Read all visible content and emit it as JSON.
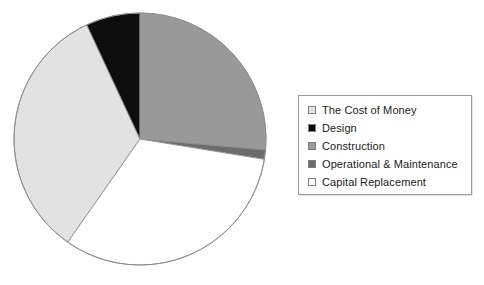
{
  "chart_data": {
    "type": "pie",
    "title": "",
    "subtitle": "",
    "legend_position": "right",
    "start_angle_deg": 0,
    "direction": "clockwise",
    "categories": [
      "The Cost of Money",
      "Design",
      "Construction",
      "Operational & Maintenance",
      "Capital Replacement"
    ],
    "values": [
      33.3,
      7.0,
      26.4,
      1.2,
      32.1
    ],
    "unit": "percent",
    "colors": [
      "#e2e2e2",
      "#0d0d0d",
      "#999999",
      "#6b6b6b",
      "#ffffff"
    ],
    "slices": [
      {
        "label": "The Cost of Money",
        "value": 33.3,
        "color": "#e2e2e2",
        "start_angle_deg": 215,
        "end_angle_deg": 335
      },
      {
        "label": "Design",
        "value": 7.0,
        "color": "#0d0d0d",
        "start_angle_deg": 335,
        "end_angle_deg": 360
      },
      {
        "label": "Construction",
        "value": 26.4,
        "color": "#999999",
        "start_angle_deg": 0,
        "end_angle_deg": 95
      },
      {
        "label": "Operational & Maintenance",
        "value": 1.2,
        "color": "#6b6b6b",
        "start_angle_deg": 95,
        "end_angle_deg": 99.3
      },
      {
        "label": "Capital Replacement",
        "value": 32.1,
        "color": "#ffffff",
        "start_angle_deg": 99.3,
        "end_angle_deg": 215
      }
    ],
    "geometry": {
      "center_x": 140,
      "center_y": 139,
      "radius": 126,
      "outline_color": "#8f8f8f"
    }
  },
  "legend": {
    "border_color": "#9a9a9a",
    "items": [
      {
        "label": "The Cost of Money",
        "swatch_color": "#e2e2e2",
        "swatch_name": "swatch-cost-of-money"
      },
      {
        "label": "Design",
        "swatch_color": "#0d0d0d",
        "swatch_name": "swatch-design"
      },
      {
        "label": "Construction",
        "swatch_color": "#999999",
        "swatch_name": "swatch-construction"
      },
      {
        "label": "Operational & Maintenance",
        "swatch_color": "#6b6b6b",
        "swatch_name": "swatch-operational-maintenance"
      },
      {
        "label": "Capital Replacement",
        "swatch_color": "#ffffff",
        "swatch_name": "swatch-capital-replacement"
      }
    ]
  }
}
